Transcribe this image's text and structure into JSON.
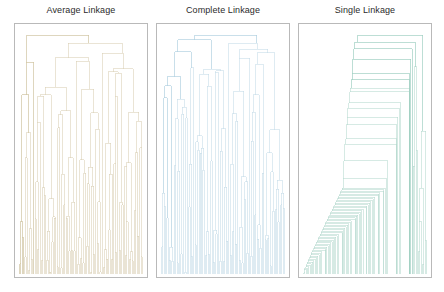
{
  "figure": {
    "background": "#ffffff",
    "frame_color": "#b9b9b9",
    "panel_count": 3
  },
  "panels": [
    {
      "title": "Average Linkage",
      "color": "#d9cdb2",
      "color_dark": "#c9b98f",
      "x": 14,
      "y": 23,
      "width": 134,
      "height": 255,
      "title_cx": 81
    },
    {
      "title": "Complete Linkage",
      "color": "#c3dbe8",
      "color_dark": "#9fc7dc",
      "x": 156,
      "y": 23,
      "width": 134,
      "height": 255,
      "title_cx": 223
    },
    {
      "title": "Single Linkage",
      "color": "#b3d9cd",
      "color_dark": "#8dc8b6",
      "x": 298,
      "y": 23,
      "width": 134,
      "height": 255,
      "title_cx": 365
    }
  ],
  "chart_data": {
    "type": "line",
    "chart_kind": "dendrogram-panel-grid",
    "title": "",
    "xlabel": "",
    "ylabel": "",
    "grid": false,
    "legend_position": "none",
    "orientation": "top-down",
    "panels": [
      {
        "name": "Average Linkage",
        "linkage": "average",
        "color": "#d9cdb2",
        "xlim": [
          0,
          1
        ],
        "ylim": [
          0,
          1
        ],
        "n_leaves": 96,
        "root_merge_height": 0.93,
        "description": "Balanced two-cluster split near the top; moderately balanced subtrees; broad fan of leaves with most merges in the lower third.",
        "top_links": [
          {
            "x1": 0.02,
            "x2": 0.78,
            "y": 0.93
          },
          {
            "x1": 0.02,
            "x2": 0.08,
            "y": 0.72
          },
          {
            "x1": 0.55,
            "x2": 0.95,
            "y": 0.86
          },
          {
            "x1": 0.3,
            "x2": 0.7,
            "y": 0.75
          },
          {
            "x1": 0.18,
            "x2": 0.45,
            "y": 0.66
          },
          {
            "x1": 0.6,
            "x2": 0.88,
            "y": 0.7
          }
        ]
      },
      {
        "name": "Complete Linkage",
        "linkage": "complete",
        "color": "#c3dbe8",
        "xlim": [
          0,
          1
        ],
        "ylim": [
          0,
          1
        ],
        "n_leaves": 96,
        "root_merge_height": 0.95,
        "description": "Most balanced dendrogram of the three; compact clusters, two large sibling groups of similar size joining at the root.",
        "top_links": [
          {
            "x1": 0.1,
            "x2": 0.58,
            "y": 0.95
          },
          {
            "x1": 0.06,
            "x2": 0.16,
            "y": 0.8
          },
          {
            "x1": 0.4,
            "x2": 0.8,
            "y": 0.84
          },
          {
            "x1": 0.25,
            "x2": 0.52,
            "y": 0.7
          },
          {
            "x1": 0.66,
            "x2": 0.92,
            "y": 0.72
          }
        ]
      },
      {
        "name": "Single Linkage",
        "linkage": "single",
        "color": "#b3d9cd",
        "xlim": [
          0,
          1
        ],
        "ylim": [
          0,
          1
        ],
        "n_leaves": 96,
        "root_merge_height": 0.96,
        "description": "Strong chaining effect: a long staircase of successive single-point merges descending left-to-right, producing a highly unbalanced tree.",
        "top_links": [
          {
            "x1": 0.02,
            "x2": 0.55,
            "y": 0.96
          },
          {
            "x1": 0.02,
            "x2": 0.06,
            "y": 0.86
          },
          {
            "x1": 0.1,
            "x2": 0.97,
            "y": 0.82
          },
          {
            "x1": 0.14,
            "x2": 0.95,
            "y": 0.78
          },
          {
            "x1": 0.18,
            "x2": 0.9,
            "y": 0.74
          }
        ]
      }
    ]
  }
}
